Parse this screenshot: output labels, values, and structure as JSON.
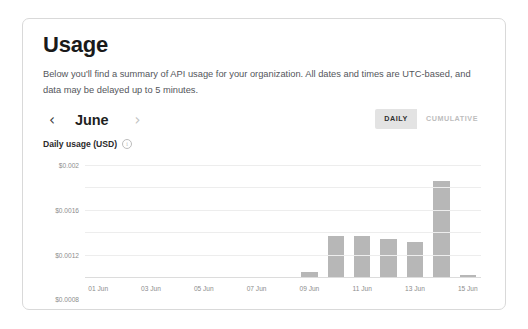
{
  "page": {
    "title": "Usage",
    "description": "Below you'll find a summary of API usage for your organization. All dates and times are UTC-based, and data may be delayed up to 5 minutes."
  },
  "controls": {
    "prev_label": "‹",
    "next_label": "›",
    "month": "June",
    "view_modes": [
      {
        "label": "DAILY",
        "active": true
      },
      {
        "label": "CUMULATIVE",
        "active": false
      }
    ]
  },
  "chart_header": {
    "title": "Daily usage (USD)",
    "info_glyph": "i"
  },
  "chart_data": {
    "type": "bar",
    "title": "Daily usage (USD)",
    "xlabel": "",
    "ylabel": "",
    "grid": true,
    "legend": null,
    "ylim": [
      0,
      0.002
    ],
    "ytick_labels": [
      "$0.002",
      "$0.0016",
      "$0.0012",
      "$0.0008",
      "$0.0004",
      "$0.00"
    ],
    "ytick_values": [
      0.002,
      0.0016,
      0.0012,
      0.0008,
      0.0004,
      0
    ],
    "categories": [
      "01 Jun",
      "02 Jun",
      "03 Jun",
      "04 Jun",
      "05 Jun",
      "06 Jun",
      "07 Jun",
      "08 Jun",
      "09 Jun",
      "10 Jun",
      "11 Jun",
      "12 Jun",
      "13 Jun",
      "14 Jun",
      "15 Jun"
    ],
    "xtick_labels": [
      "01 Jun",
      "03 Jun",
      "05 Jun",
      "07 Jun",
      "09 Jun",
      "11 Jun",
      "13 Jun",
      "15 Jun"
    ],
    "values": [
      0,
      0,
      0,
      0,
      0,
      0,
      0,
      0,
      9e-05,
      0.00073,
      0.00073,
      0.00068,
      0.00062,
      0.00171,
      3e-05
    ],
    "bar_color": "#b7b7b7"
  }
}
